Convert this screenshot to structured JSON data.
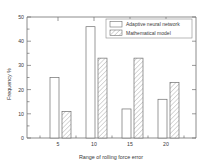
{
  "chart_data": {
    "type": "bar",
    "title": "",
    "xlabel": "Range of rolling force error",
    "ylabel": "Frequency %",
    "categories": [
      "5",
      "10",
      "15",
      "20"
    ],
    "series": [
      {
        "name": "Adaptive neural network",
        "fill": "open",
        "values": [
          25,
          46,
          12,
          16
        ]
      },
      {
        "name": "Mathematical model",
        "fill": "hatched",
        "values": [
          11,
          33,
          33,
          23
        ]
      }
    ],
    "ylim": [
      0,
      50
    ],
    "yticks": [
      "0",
      "10",
      "20",
      "30",
      "40",
      "50"
    ],
    "ytick_values": [
      0,
      10,
      20,
      30,
      40,
      50
    ],
    "xticks": [
      "5",
      "10",
      "15",
      "20"
    ],
    "grid": false,
    "legend_position": "top-right",
    "colors": {
      "axis": "#6e6e6e",
      "text": "#3a3a3a",
      "bar_open_fill": "#ffffff",
      "bar_stroke": "#6e6e6e",
      "hatch_stroke": "#b9b9b9",
      "background": "#ffffff"
    }
  }
}
